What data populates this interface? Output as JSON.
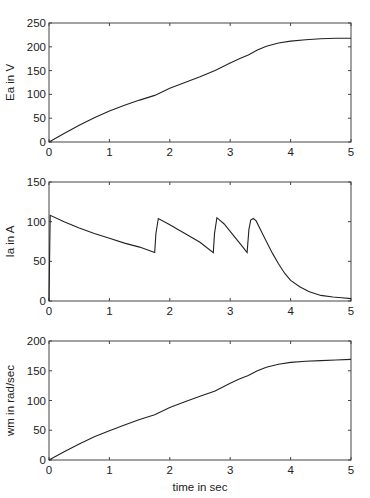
{
  "chart_data": [
    {
      "type": "line",
      "title": "",
      "xlabel": "",
      "ylabel": "Ea in V",
      "xlim": [
        0,
        5
      ],
      "ylim": [
        0,
        250
      ],
      "xticks": [
        0,
        1,
        2,
        3,
        4,
        5
      ],
      "yticks": [
        0,
        50,
        100,
        150,
        200,
        250
      ],
      "grid": false,
      "series": [
        {
          "name": "Ea",
          "x": [
            0,
            0.25,
            0.5,
            0.75,
            1.0,
            1.25,
            1.5,
            1.75,
            2.0,
            2.25,
            2.5,
            2.75,
            3.0,
            3.15,
            3.3,
            3.45,
            3.6,
            3.8,
            4.0,
            4.25,
            4.5,
            4.75,
            5.0
          ],
          "values": [
            0,
            18,
            35,
            51,
            65,
            77,
            88,
            98,
            113,
            125,
            137,
            150,
            166,
            175,
            183,
            193,
            201,
            208,
            212,
            215,
            217,
            218,
            218
          ]
        }
      ]
    },
    {
      "type": "line",
      "title": "",
      "xlabel": "",
      "ylabel": "Ia in A",
      "xlim": [
        0,
        5
      ],
      "ylim": [
        0,
        150
      ],
      "xticks": [
        0,
        1,
        2,
        3,
        4,
        5
      ],
      "yticks": [
        0,
        50,
        100,
        150
      ],
      "grid": false,
      "series": [
        {
          "name": "Ia",
          "x": [
            0,
            0.02,
            0.25,
            0.5,
            0.75,
            1.0,
            1.25,
            1.5,
            1.75,
            1.77,
            1.81,
            2.0,
            2.25,
            2.5,
            2.72,
            2.74,
            2.78,
            2.9,
            3.05,
            3.2,
            3.28,
            3.31,
            3.34,
            3.38,
            3.43,
            3.5,
            3.6,
            3.7,
            3.8,
            3.9,
            4.0,
            4.15,
            4.3,
            4.5,
            4.7,
            4.85,
            5.0
          ],
          "values": [
            0,
            108,
            100,
            92,
            85,
            79,
            73,
            68,
            61,
            85,
            104,
            96,
            85,
            74,
            61,
            85,
            105,
            97,
            83,
            69,
            61,
            90,
            102,
            104,
            101,
            90,
            75,
            60,
            47,
            35,
            26,
            18,
            12,
            7,
            5,
            4,
            3
          ]
        }
      ]
    },
    {
      "type": "line",
      "title": "",
      "xlabel": "time in sec",
      "ylabel": "wm in rad/sec",
      "xlim": [
        0,
        5
      ],
      "ylim": [
        0,
        200
      ],
      "xticks": [
        0,
        1,
        2,
        3,
        4,
        5
      ],
      "yticks": [
        0,
        50,
        100,
        150,
        200
      ],
      "grid": false,
      "series": [
        {
          "name": "wm",
          "x": [
            0,
            0.25,
            0.5,
            0.75,
            1.0,
            1.25,
            1.5,
            1.75,
            2.0,
            2.25,
            2.5,
            2.75,
            3.0,
            3.15,
            3.3,
            3.45,
            3.6,
            3.8,
            4.0,
            4.25,
            4.5,
            4.75,
            5.0
          ],
          "values": [
            0,
            14,
            27,
            39,
            49,
            59,
            68,
            76,
            88,
            98,
            107,
            116,
            129,
            136,
            142,
            150,
            156,
            161,
            164,
            166,
            167,
            168,
            169
          ]
        }
      ]
    }
  ],
  "labels": {
    "plot1_ylabel": "Ea in V",
    "plot2_ylabel": "Ia in A",
    "plot3_ylabel": "wm in rad/sec",
    "xlabel": "time in sec"
  },
  "colors": {
    "line": "#222222",
    "frame": "#444444",
    "background": "#ffffff"
  }
}
